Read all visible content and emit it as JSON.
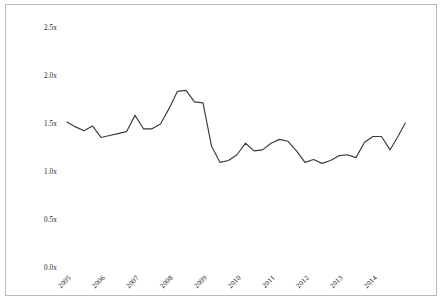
{
  "chart_data": {
    "type": "line",
    "title": "",
    "subtitle": "",
    "xlabel": "",
    "ylabel": "",
    "grid": false,
    "legend": "none",
    "line_color": "#3a3a3a",
    "background_color": "#ffffff",
    "frame_color": "#b9b9b9",
    "ylim": [
      0.0,
      2.5
    ],
    "ytick_labels": [
      "2.5x",
      "2.0x",
      "1.5x",
      "1.0x",
      "0.5x",
      "0.0x"
    ],
    "ytick_values": [
      2.5,
      2.0,
      1.5,
      1.0,
      0.5,
      0.0
    ],
    "xtick_labels": [
      "2005",
      "2006",
      "2007",
      "2008",
      "2009",
      "2010",
      "2011",
      "2012",
      "2013",
      "2014"
    ],
    "xtick_values": [
      2005,
      2006,
      2007,
      2008,
      2009,
      2010,
      2011,
      2012,
      2013,
      2014
    ],
    "xlim": [
      2005.0,
      2014.95
    ],
    "x": [
      2005.0,
      2005.25,
      2005.5,
      2005.75,
      2006.0,
      2006.25,
      2006.5,
      2006.75,
      2007.0,
      2007.25,
      2007.5,
      2007.75,
      2008.0,
      2008.25,
      2008.5,
      2008.75,
      2009.0,
      2009.25,
      2009.5,
      2009.75,
      2010.0,
      2010.25,
      2010.5,
      2010.75,
      2011.0,
      2011.25,
      2011.5,
      2011.75,
      2012.0,
      2012.25,
      2012.5,
      2012.75,
      2013.0,
      2013.25,
      2013.5,
      2013.75,
      2014.0,
      2014.25,
      2014.5,
      2014.75,
      2014.95
    ],
    "values": [
      1.52,
      1.47,
      1.43,
      1.48,
      1.36,
      1.38,
      1.4,
      1.42,
      1.59,
      1.45,
      1.45,
      1.5,
      1.66,
      1.84,
      1.85,
      1.73,
      1.72,
      1.27,
      1.1,
      1.12,
      1.18,
      1.3,
      1.22,
      1.23,
      1.3,
      1.34,
      1.32,
      1.22,
      1.1,
      1.13,
      1.09,
      1.12,
      1.17,
      1.18,
      1.15,
      1.31,
      1.37,
      1.37,
      1.23,
      1.38,
      1.51
    ],
    "series_name": ""
  },
  "axes": {
    "y_ticks": [
      {
        "label": "2.5x",
        "y_px": 28
      },
      {
        "label": "2.0x",
        "y_px": 76
      },
      {
        "label": "1.5x",
        "y_px": 124
      },
      {
        "label": "1.0x",
        "y_px": 172
      },
      {
        "label": "0.5x",
        "y_px": 220
      },
      {
        "label": "0.0x",
        "y_px": 268
      }
    ],
    "x_ticks": [
      {
        "label": "2005",
        "x_px": 67
      },
      {
        "label": "2006",
        "x_px": 101
      },
      {
        "label": "2007",
        "x_px": 135
      },
      {
        "label": "2008",
        "x_px": 169
      },
      {
        "label": "2009",
        "x_px": 203
      },
      {
        "label": "2010",
        "x_px": 237
      },
      {
        "label": "2011",
        "x_px": 271
      },
      {
        "label": "2012",
        "x_px": 305
      },
      {
        "label": "2013",
        "x_px": 339
      },
      {
        "label": "2014",
        "x_px": 373
      }
    ]
  }
}
